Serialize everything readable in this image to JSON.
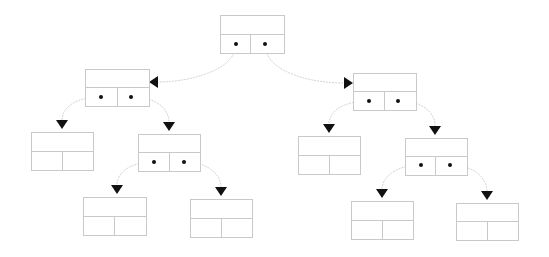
{
  "diagram": {
    "title": "",
    "type": "binary-tree-linked-nodes",
    "colors": {
      "background": "#ffffff",
      "box_stroke": "#c9c9c9",
      "edge": "#d4d4d4",
      "dot": "#111111",
      "arrow": "#111111"
    },
    "nodes": [
      {
        "id": "root",
        "x": 220,
        "y": 15,
        "w": 64,
        "h": 38,
        "split_y": 34,
        "div_x": 250,
        "pointers": [
          [
            236,
            44
          ],
          [
            265,
            44
          ]
        ]
      },
      {
        "id": "L",
        "x": 85,
        "y": 69,
        "w": 64,
        "h": 37,
        "split_y": 87,
        "div_x": 117,
        "pointers": [
          [
            101,
            97
          ],
          [
            131,
            97
          ]
        ]
      },
      {
        "id": "R",
        "x": 353,
        "y": 73,
        "w": 63,
        "h": 37,
        "split_y": 91,
        "div_x": 384,
        "pointers": [
          [
            369,
            101
          ],
          [
            398,
            101
          ]
        ]
      },
      {
        "id": "LL",
        "x": 31,
        "y": 132,
        "w": 62,
        "h": 38,
        "split_y": 151,
        "div_x": 62,
        "pointers": []
      },
      {
        "id": "LR",
        "x": 138,
        "y": 134,
        "w": 62,
        "h": 37,
        "split_y": 152,
        "div_x": 169,
        "pointers": [
          [
            154,
            162
          ],
          [
            184,
            162
          ]
        ]
      },
      {
        "id": "RL",
        "x": 298,
        "y": 136,
        "w": 62,
        "h": 38,
        "split_y": 155,
        "div_x": 329,
        "pointers": []
      },
      {
        "id": "RR",
        "x": 405,
        "y": 138,
        "w": 62,
        "h": 37,
        "split_y": 156,
        "div_x": 435,
        "pointers": [
          [
            421,
            165
          ],
          [
            450,
            165
          ]
        ]
      },
      {
        "id": "LRL",
        "x": 83,
        "y": 197,
        "w": 63,
        "h": 38,
        "split_y": 216,
        "div_x": 114,
        "pointers": []
      },
      {
        "id": "LRR",
        "x": 190,
        "y": 199,
        "w": 62,
        "h": 38,
        "split_y": 218,
        "div_x": 221,
        "pointers": []
      },
      {
        "id": "RRL",
        "x": 351,
        "y": 201,
        "w": 62,
        "h": 38,
        "split_y": 220,
        "div_x": 382,
        "pointers": []
      },
      {
        "id": "RRR",
        "x": 456,
        "y": 203,
        "w": 62,
        "h": 37,
        "split_y": 221,
        "div_x": 487,
        "pointers": []
      }
    ],
    "edges": [
      {
        "from": "root.left",
        "to": "L",
        "path": "M236,44 C236,70 190,82 158,82",
        "arrow": {
          "x": 150,
          "y": 82,
          "dir": "left"
        }
      },
      {
        "from": "root.right",
        "to": "R",
        "path": "M265,44 C265,72 310,83 344,83",
        "arrow": {
          "x": 352,
          "y": 83,
          "dir": "right"
        }
      },
      {
        "from": "L.left",
        "to": "LL",
        "path": "M101,97 C75,97 62,108 62,120",
        "arrow": {
          "x": 62,
          "y": 128,
          "dir": "down"
        }
      },
      {
        "from": "L.right",
        "to": "LR",
        "path": "M131,97 C158,97 169,110 169,122",
        "arrow": {
          "x": 169,
          "y": 130,
          "dir": "down"
        }
      },
      {
        "from": "R.left",
        "to": "RL",
        "path": "M369,101 C342,101 329,112 329,124",
        "arrow": {
          "x": 329,
          "y": 132,
          "dir": "down"
        }
      },
      {
        "from": "R.right",
        "to": "RR",
        "path": "M398,101 C425,101 435,114 435,126",
        "arrow": {
          "x": 435,
          "y": 134,
          "dir": "down"
        }
      },
      {
        "from": "LR.left",
        "to": "LRL",
        "path": "M154,162 C128,162 117,174 117,185",
        "arrow": {
          "x": 117,
          "y": 193,
          "dir": "down"
        }
      },
      {
        "from": "LR.right",
        "to": "LRR",
        "path": "M184,162 C210,162 221,176 221,187",
        "arrow": {
          "x": 221,
          "y": 195,
          "dir": "down"
        }
      },
      {
        "from": "RR.left",
        "to": "RRL",
        "path": "M421,165 C395,165 382,178 382,189",
        "arrow": {
          "x": 382,
          "y": 197,
          "dir": "down"
        }
      },
      {
        "from": "RR.right",
        "to": "RRR",
        "path": "M450,165 C476,165 487,180 487,191",
        "arrow": {
          "x": 487,
          "y": 199,
          "dir": "down"
        }
      }
    ]
  }
}
